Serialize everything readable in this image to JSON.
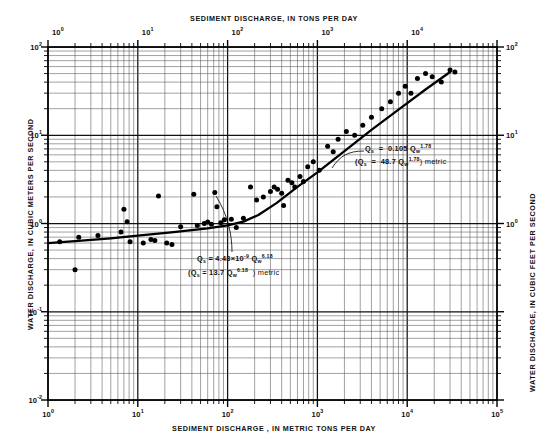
{
  "chart_data": {
    "type": "scatter",
    "title": "",
    "xlabel": "SEDIMENT DISCHARGE, IN METRIC TONS PER DAY",
    "xlabel_top": "SEDIMENT DISCHARGE, IN TONS PER DAY",
    "ylabel": "WATER DISCHARGE, IN CUBIC METERS PER SECOND",
    "ylabel_right": "WATER DISCHARGE, IN CUBIC FEET PER SECOND",
    "scale": "log-log",
    "grid": true,
    "legend_position": "none",
    "xlim": [
      1,
      100000
    ],
    "ylim": [
      0.01,
      100
    ],
    "xticks_bottom": [
      "10⁰",
      "10¹",
      "10²",
      "10³",
      "10⁴",
      "10⁵"
    ],
    "xticks_bottom_values": [
      1,
      10,
      100,
      1000,
      10000,
      100000
    ],
    "xticks_top": [
      "10⁰",
      "10¹",
      "10²",
      "10³",
      "10⁴"
    ],
    "xticks_top_values": [
      1,
      10,
      100,
      1000,
      10000
    ],
    "yticks_left": [
      "10⁻²",
      "10⁻¹",
      "10⁰",
      "10¹",
      "10²"
    ],
    "yticks_left_values": [
      0.01,
      0.1,
      1,
      10,
      100
    ],
    "yticks_right": [
      "10⁰",
      "10¹",
      "10²",
      "10³"
    ],
    "yticks_right_values": [
      1,
      10,
      100,
      1000
    ],
    "series": [
      {
        "name": "observations",
        "marker": "filled-circle",
        "points": [
          [
            2.0,
            0.3
          ],
          [
            1.35,
            0.62
          ],
          [
            2.2,
            0.7
          ],
          [
            3.6,
            0.73
          ],
          [
            6.5,
            0.8
          ],
          [
            7.0,
            1.45
          ],
          [
            7.6,
            1.05
          ],
          [
            8.2,
            0.62
          ],
          [
            11.5,
            0.6
          ],
          [
            14.0,
            0.66
          ],
          [
            15.5,
            0.64
          ],
          [
            17.0,
            2.05
          ],
          [
            21.0,
            0.6
          ],
          [
            24.0,
            0.58
          ],
          [
            30.0,
            0.92
          ],
          [
            42.0,
            2.15
          ],
          [
            46.0,
            0.95
          ],
          [
            55.0,
            1.0
          ],
          [
            60.0,
            1.04
          ],
          [
            66.0,
            0.98
          ],
          [
            72.0,
            2.25
          ],
          [
            76.0,
            1.55
          ],
          [
            84.0,
            1.02
          ],
          [
            92.0,
            1.1
          ],
          [
            110.0,
            1.12
          ],
          [
            125.0,
            0.9
          ],
          [
            150.0,
            1.15
          ],
          [
            180.0,
            2.6
          ],
          [
            210.0,
            1.85
          ],
          [
            250.0,
            2.0
          ],
          [
            300.0,
            2.3
          ],
          [
            330.0,
            2.6
          ],
          [
            360.0,
            2.45
          ],
          [
            400.0,
            2.2
          ],
          [
            420.0,
            1.6
          ],
          [
            470.0,
            3.1
          ],
          [
            520.0,
            2.9
          ],
          [
            560.0,
            2.6
          ],
          [
            640.0,
            3.4
          ],
          [
            700.0,
            3.0
          ],
          [
            780.0,
            4.4
          ],
          [
            900.0,
            5.0
          ],
          [
            1050.0,
            4.0
          ],
          [
            1300.0,
            7.5
          ],
          [
            1500.0,
            6.5
          ],
          [
            1700.0,
            9.0
          ],
          [
            2100.0,
            11.0
          ],
          [
            2600.0,
            10.0
          ],
          [
            3200.0,
            13.0
          ],
          [
            4000.0,
            16.0
          ],
          [
            5200.0,
            20.0
          ],
          [
            6500.0,
            24.0
          ],
          [
            8000.0,
            30.0
          ],
          [
            9500.0,
            36.0
          ],
          [
            11000.0,
            30.0
          ],
          [
            13000.0,
            44.0
          ],
          [
            16000.0,
            50.0
          ],
          [
            19000.0,
            46.0
          ],
          [
            24000.0,
            40.0
          ],
          [
            30000.0,
            55.0
          ],
          [
            34000.0,
            52.0
          ]
        ]
      }
    ],
    "fit_curve": {
      "name": "rating-curve",
      "description": "two-segment power-law rating curve",
      "points": [
        [
          1.0,
          0.6
        ],
        [
          2.0,
          0.63
        ],
        [
          5.0,
          0.68
        ],
        [
          10.0,
          0.73
        ],
        [
          25.0,
          0.8
        ],
        [
          60.0,
          0.88
        ],
        [
          100.0,
          0.95
        ],
        [
          150.0,
          1.05
        ],
        [
          220.0,
          1.25
        ],
        [
          350.0,
          1.7
        ],
        [
          600.0,
          2.6
        ],
        [
          1000.0,
          3.8
        ],
        [
          2000.0,
          6.6
        ],
        [
          4000.0,
          11.5
        ],
        [
          8000.0,
          19.5
        ],
        [
          16000.0,
          33.0
        ],
        [
          30000.0,
          52.0
        ]
      ]
    },
    "annotations": [
      {
        "name": "upper-equation",
        "line1": {
          "lhs": "Q",
          "lhs_sub": "s",
          "eq": "=",
          "coef": "0.105 Q",
          "var_sub": "w",
          "exp": "1.78"
        },
        "line2": {
          "lhs": "(Q",
          "lhs_sub": "s",
          "eq": "=",
          "coef": "48.7 Q",
          "var_sub": "w",
          "exp": "1.78",
          "close": ") metric"
        },
        "text_plain": "Qs = 0.105 Qw^1.78  (Qs = 48.7 Qw^1.78) metric"
      },
      {
        "name": "lower-equation",
        "line1": {
          "lhs": "Q",
          "lhs_sub": "s",
          "eq": "=",
          "coef": "4.43×10",
          "coef_exp": "-9",
          "coef2": " Q",
          "var_sub": "w",
          "exp": "6.18"
        },
        "line2": {
          "lhs": "(Q",
          "lhs_sub": "s",
          "eq": "=",
          "coef": "13.7 Q",
          "var_sub": "w",
          "exp": "6.18",
          "close": ") metric"
        },
        "text_plain": "Qs = 4.43x10^-9 Qw^6.18  (Qs = 13.7 Qw^6.18) metric"
      }
    ]
  },
  "labels": {
    "top_axis": "SEDIMENT  DISCHARGE, IN  TONS PER DAY",
    "bottom_axis": "SEDIMENT  DISCHARGE , IN  METRIC TONS PER DAY",
    "left_axis": "WATER  DISCHARGE, IN CUBIC METERS PER SECOND",
    "right_axis": "WATER DISCHARGE, IN CUBIC FEET PER SECOND"
  }
}
